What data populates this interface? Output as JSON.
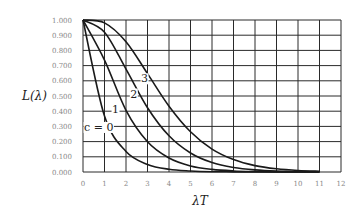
{
  "chart_data": {
    "type": "line",
    "title": "",
    "xlabel": "λT",
    "ylabel": "L(λ)",
    "xlim": [
      0,
      12
    ],
    "ylim": [
      0,
      1
    ],
    "grid": true,
    "legend": "inline curve labels",
    "x_ticks": [
      "0",
      "1",
      "2",
      "3",
      "4",
      "5",
      "6",
      "7",
      "8",
      "9",
      "10",
      "11",
      "12"
    ],
    "y_ticks": [
      "0.000",
      "0.100",
      "0.200",
      "0.300",
      "0.400",
      "0.500",
      "0.600",
      "0.700",
      "0.800",
      "0.900",
      "1.000"
    ],
    "x": [
      0,
      1,
      2,
      3,
      4,
      5,
      6,
      7,
      8,
      9,
      10,
      11
    ],
    "series": [
      {
        "name": "c=0",
        "label": "c = 0",
        "values": [
          1.0,
          0.368,
          0.135,
          0.05,
          0.018,
          0.007,
          0.002,
          0.001,
          0.0,
          0.0,
          0.0,
          0.0
        ]
      },
      {
        "name": "c=1",
        "label": "1",
        "values": [
          1.0,
          0.736,
          0.406,
          0.199,
          0.092,
          0.04,
          0.017,
          0.007,
          0.003,
          0.001,
          0.0,
          0.0
        ]
      },
      {
        "name": "c=2",
        "label": "2",
        "values": [
          1.0,
          0.92,
          0.677,
          0.423,
          0.238,
          0.125,
          0.062,
          0.03,
          0.014,
          0.006,
          0.003,
          0.001
        ]
      },
      {
        "name": "c=3",
        "label": "3",
        "values": [
          1.0,
          0.981,
          0.857,
          0.647,
          0.433,
          0.265,
          0.151,
          0.082,
          0.042,
          0.021,
          0.01,
          0.005
        ]
      }
    ],
    "annotations": [
      {
        "text": "c = 0",
        "x": 0.05,
        "y": 0.27
      },
      {
        "text": "1",
        "x": 1.35,
        "y": 0.39
      },
      {
        "text": "2",
        "x": 2.2,
        "y": 0.49
      },
      {
        "text": "3",
        "x": 2.7,
        "y": 0.59
      }
    ]
  }
}
